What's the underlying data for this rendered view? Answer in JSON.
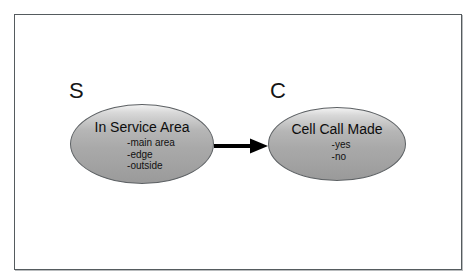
{
  "diagram": {
    "type": "bayesian-network",
    "background_color": "#ffffff",
    "frame_color": "#555b5e",
    "node_fill_top": "#f2f2f2",
    "node_fill_bottom": "#9a9a9a",
    "node_border_color": "#5d6164",
    "arrow_color": "#000000",
    "nodes": [
      {
        "tag": "S",
        "title": "In Service Area",
        "options": [
          "-main area",
          "-edge",
          "-outside"
        ]
      },
      {
        "tag": "C",
        "title": "Cell Call Made",
        "options": [
          "-yes",
          "-no"
        ]
      }
    ],
    "edges": [
      {
        "from": "S",
        "to": "C",
        "style": "solid-arrow",
        "direction": "right"
      }
    ]
  }
}
